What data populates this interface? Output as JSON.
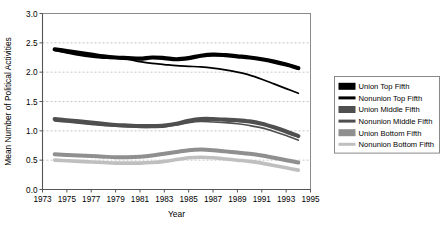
{
  "chart_data": {
    "type": "line",
    "title": "",
    "xlabel": "Year",
    "ylabel": "Mean Number of Political Activities",
    "xlim": [
      1973,
      1995
    ],
    "ylim": [
      0.0,
      3.0
    ],
    "grid": true,
    "legend_position": "right",
    "xticks": [
      1973,
      1975,
      1977,
      1979,
      1981,
      1983,
      1985,
      1987,
      1989,
      1991,
      1993,
      1995
    ],
    "xtick_labels": [
      "1973",
      "1975",
      "1977",
      "1979",
      "1981",
      "1983",
      "1985",
      "1987",
      "1989",
      "1991",
      "1993",
      "1995"
    ],
    "yticks": [
      0.0,
      0.5,
      1.0,
      1.5,
      2.0,
      2.5,
      3.0
    ],
    "ytick_labels": [
      "0.0",
      "0.5",
      "1.0",
      "1.5",
      "2.0",
      "2.5",
      "3.0"
    ],
    "x": [
      1974,
      1975,
      1976,
      1977,
      1978,
      1979,
      1980,
      1981,
      1982,
      1983,
      1984,
      1985,
      1986,
      1987,
      1988,
      1989,
      1990,
      1991,
      1992,
      1993,
      1994
    ],
    "series": [
      {
        "name": "Union Top Fifth",
        "color": "#000000",
        "width": 4.2,
        "values": [
          2.39,
          2.36,
          2.33,
          2.3,
          2.27,
          2.25,
          2.24,
          2.23,
          2.25,
          2.24,
          2.22,
          2.24,
          2.28,
          2.3,
          2.29,
          2.27,
          2.25,
          2.22,
          2.18,
          2.13,
          2.07
        ]
      },
      {
        "name": "Nonunion Top Fifth",
        "color": "#000000",
        "width": 1.7,
        "values": [
          2.37,
          2.33,
          2.29,
          2.26,
          2.24,
          2.24,
          2.22,
          2.18,
          2.15,
          2.13,
          2.11,
          2.1,
          2.09,
          2.07,
          2.04,
          2.0,
          1.95,
          1.88,
          1.8,
          1.72,
          1.64
        ]
      },
      {
        "name": "Union Middle Fifth",
        "color": "#4f4f4f",
        "width": 4.2,
        "values": [
          1.2,
          1.18,
          1.16,
          1.14,
          1.12,
          1.1,
          1.09,
          1.08,
          1.08,
          1.09,
          1.12,
          1.17,
          1.2,
          1.2,
          1.19,
          1.18,
          1.16,
          1.12,
          1.06,
          0.99,
          0.91
        ]
      },
      {
        "name": "Nonunion Middle Fifth",
        "color": "#4f4f4f",
        "width": 1.6,
        "values": [
          1.17,
          1.15,
          1.13,
          1.11,
          1.09,
          1.08,
          1.07,
          1.06,
          1.06,
          1.07,
          1.1,
          1.14,
          1.16,
          1.15,
          1.14,
          1.12,
          1.09,
          1.05,
          0.99,
          0.92,
          0.84
        ]
      },
      {
        "name": "Union Bottom Fifth",
        "color": "#8f8f8f",
        "width": 4.0,
        "values": [
          0.6,
          0.59,
          0.58,
          0.57,
          0.56,
          0.55,
          0.55,
          0.56,
          0.58,
          0.61,
          0.64,
          0.67,
          0.68,
          0.67,
          0.65,
          0.63,
          0.61,
          0.58,
          0.54,
          0.5,
          0.46
        ]
      },
      {
        "name": "Nonunion Bottom Fifth",
        "color": "#bfbfbf",
        "width": 3.6,
        "values": [
          0.5,
          0.49,
          0.48,
          0.47,
          0.46,
          0.45,
          0.45,
          0.45,
          0.46,
          0.48,
          0.51,
          0.54,
          0.55,
          0.54,
          0.52,
          0.5,
          0.48,
          0.45,
          0.41,
          0.37,
          0.33
        ]
      }
    ]
  },
  "legend": {
    "items": [
      {
        "label": "Union Top Fifth",
        "color": "#000000",
        "thickness": 7
      },
      {
        "label": "Nonunion Top Fifth",
        "color": "#000000",
        "thickness": 3
      },
      {
        "label": "Union Middle Fifth",
        "color": "#4f4f4f",
        "thickness": 7
      },
      {
        "label": "Nonunion Middle Fifth",
        "color": "#4f4f4f",
        "thickness": 3
      },
      {
        "label": "Union Bottom Fifth",
        "color": "#8f8f8f",
        "thickness": 7
      },
      {
        "label": "Nonunion Bottom Fifth",
        "color": "#bfbfbf",
        "thickness": 3
      }
    ]
  }
}
